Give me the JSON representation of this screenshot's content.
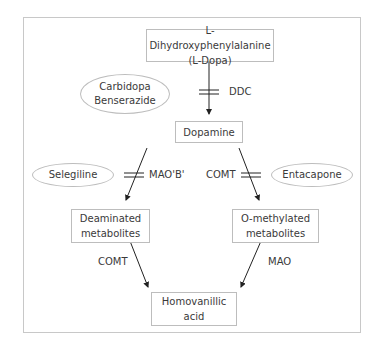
{
  "diagram": {
    "nodes": {
      "ldopa": {
        "line1": "L-Dihydroxyphenylalanine",
        "line2": "(L-Dopa)"
      },
      "dopamine": {
        "line1": "Dopamine"
      },
      "deaminated": {
        "line1": "Deaminated",
        "line2": "metabolites"
      },
      "omethylated": {
        "line1": "O-methylated",
        "line2": "metabolites"
      },
      "hva": {
        "line1": "Homovanillic",
        "line2": "acid"
      }
    },
    "inhibitors": {
      "ddc_inhibitor": {
        "line1": "Carbidopa",
        "line2": "Benserazide"
      },
      "maob_inhibitor": {
        "line1": "Selegiline"
      },
      "comt_inhibitor": {
        "line1": "Entacapone"
      }
    },
    "enzymes": {
      "ddc": "DDC",
      "maob": "MAO'B'",
      "comt_top": "COMT",
      "comt_bottom": "COMT",
      "mao_bottom": "MAO"
    },
    "edges": [
      {
        "from": "ldopa",
        "to": "dopamine",
        "enzyme": "DDC",
        "inhibited_by": "Carbidopa, Benserazide"
      },
      {
        "from": "dopamine",
        "to": "deaminated",
        "enzyme": "MAO'B'",
        "inhibited_by": "Selegiline"
      },
      {
        "from": "dopamine",
        "to": "omethylated",
        "enzyme": "COMT",
        "inhibited_by": "Entacapone"
      },
      {
        "from": "deaminated",
        "to": "hva",
        "enzyme": "COMT"
      },
      {
        "from": "omethylated",
        "to": "hva",
        "enzyme": "MAO"
      }
    ],
    "colors": {
      "line": "#222222",
      "border": "#bdbdbd",
      "text": "#3a3a3a"
    }
  }
}
